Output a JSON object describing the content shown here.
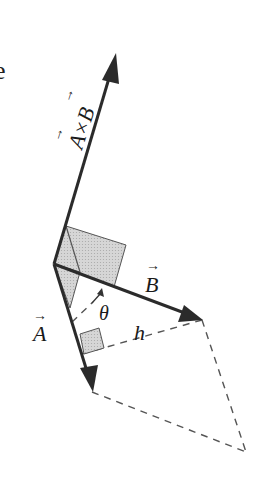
{
  "figure": {
    "partial_text": "e",
    "labels": {
      "cross_product": "A×B",
      "cross_product_arrow_a": "→",
      "cross_product_arrow_b": "→",
      "vector_a": "A",
      "vector_a_arrow": "→",
      "vector_b": "B",
      "vector_b_arrow": "→",
      "angle": "θ",
      "height": "h"
    },
    "colors": {
      "line": "#2b2b2b",
      "shade": "#cfcfcf",
      "dash": "#555555"
    }
  }
}
